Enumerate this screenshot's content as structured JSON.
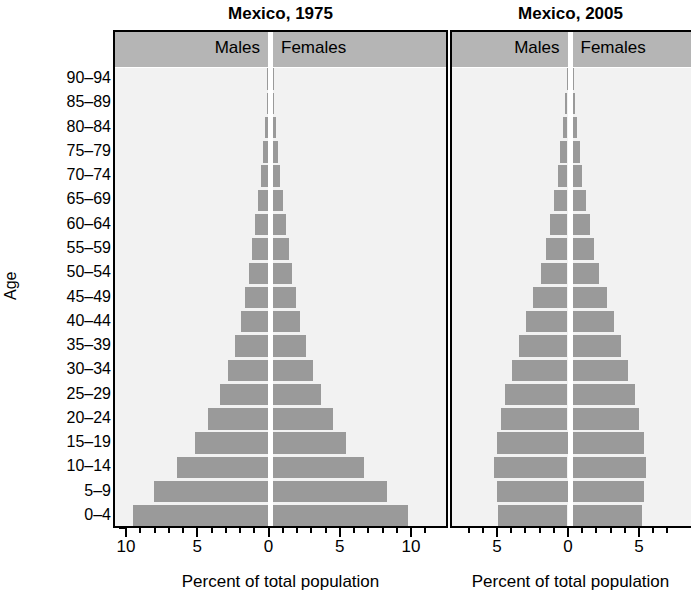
{
  "axis": {
    "y_title": "Age",
    "x_title": "Percent of total population",
    "age_groups": [
      "90–94",
      "85–89",
      "80–84",
      "75–79",
      "70–74",
      "65–69",
      "60–64",
      "55–59",
      "50–54",
      "45–49",
      "40–44",
      "35–39",
      "30–34",
      "25–29",
      "20–24",
      "15–19",
      "10–14",
      "5–9",
      "0–4"
    ]
  },
  "charts": [
    {
      "id": "left",
      "title": "Mexico, 1975",
      "males_label": "Males",
      "females_label": "Females",
      "xticklabels": [
        "10",
        "5",
        "0",
        "5",
        "10"
      ],
      "xtickvalues": [
        -10,
        -5,
        0,
        5,
        10
      ],
      "bar_color": "#9a9a9a",
      "band_color": "#b5b5b5",
      "plot_bg": "#f2f2f2"
    },
    {
      "id": "right",
      "title": "Mexico, 2005",
      "males_label": "Males",
      "females_label": "Females",
      "xticklabels": [
        "5",
        "0",
        "5"
      ],
      "xtickvalues": [
        -5,
        0,
        5
      ],
      "bar_color": "#9a9a9a",
      "band_color": "#b5b5b5",
      "plot_bg": "#f2f2f2"
    }
  ],
  "chart_data": [
    {
      "type": "bar",
      "subtype": "population-pyramid",
      "title": "Mexico, 1975",
      "xlabel": "Percent of total population",
      "ylabel": "Age",
      "xlim": [
        -11.5,
        11.5
      ],
      "xticks": [
        -10,
        -5,
        0,
        5,
        10
      ],
      "xticklabels": [
        "10",
        "5",
        "0",
        "5",
        "10"
      ],
      "grid": false,
      "legend": [
        "Males",
        "Females"
      ],
      "legend_position": "top-band",
      "categories": [
        "90–94",
        "85–89",
        "80–84",
        "75–79",
        "70–74",
        "65–69",
        "60–64",
        "55–59",
        "50–54",
        "45–49",
        "40–44",
        "35–39",
        "30–34",
        "25–29",
        "20–24",
        "15–19",
        "10–14",
        "5–9",
        "0–4"
      ],
      "series": [
        {
          "name": "Males",
          "side": "left",
          "values": [
            0.05,
            0.1,
            0.2,
            0.35,
            0.5,
            0.7,
            0.9,
            1.1,
            1.3,
            1.6,
            1.9,
            2.3,
            2.8,
            3.4,
            4.2,
            5.1,
            6.4,
            8.0,
            9.5
          ]
        },
        {
          "name": "Females",
          "side": "right",
          "values": [
            0.05,
            0.1,
            0.2,
            0.35,
            0.5,
            0.7,
            0.9,
            1.1,
            1.3,
            1.6,
            1.9,
            2.3,
            2.8,
            3.4,
            4.2,
            5.1,
            6.4,
            8.0,
            9.5
          ]
        }
      ]
    },
    {
      "type": "bar",
      "subtype": "population-pyramid",
      "title": "Mexico, 2005",
      "xlabel": "Percent of total population",
      "ylabel": "Age",
      "xlim": [
        -7.2,
        7.2
      ],
      "xticks": [
        -5,
        0,
        5
      ],
      "xticklabels": [
        "5",
        "0",
        "5"
      ],
      "grid": false,
      "legend": [
        "Males",
        "Females"
      ],
      "legend_position": "top-band",
      "categories": [
        "90–94",
        "85–89",
        "80–84",
        "75–79",
        "70–74",
        "65–69",
        "60–64",
        "55–59",
        "50–54",
        "45–49",
        "40–44",
        "35–39",
        "30–34",
        "25–29",
        "20–24",
        "15–19",
        "10–14",
        "5–9",
        "0–4"
      ],
      "series": [
        {
          "name": "Males",
          "side": "left",
          "values": [
            0.05,
            0.15,
            0.3,
            0.5,
            0.7,
            0.95,
            1.2,
            1.5,
            1.9,
            2.4,
            2.9,
            3.4,
            3.9,
            4.4,
            4.7,
            5.0,
            5.2,
            5.0,
            4.9
          ]
        },
        {
          "name": "Females",
          "side": "right",
          "values": [
            0.05,
            0.15,
            0.3,
            0.5,
            0.7,
            0.95,
            1.2,
            1.5,
            1.9,
            2.4,
            2.9,
            3.4,
            3.9,
            4.4,
            4.7,
            5.0,
            5.2,
            5.0,
            4.9
          ]
        }
      ]
    }
  ]
}
